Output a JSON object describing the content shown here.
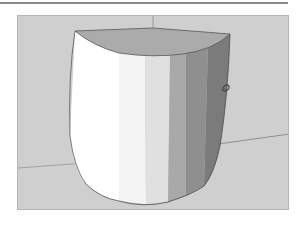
{
  "app": {
    "kind": "3d-modeling-viewport"
  },
  "viewport": {
    "background_color": "#cfcfcf",
    "model": {
      "shape": "extruded-arc-solid",
      "top_face_color": "#a9a9a9",
      "facet_colors": [
        "#ffffff",
        "#f0f0f0",
        "#e2e2e2",
        "#a8a8a8",
        "#8e8e8e",
        "#7a7a7a"
      ],
      "edge_color": "#4a4a4a"
    },
    "axes": {
      "color": "#9a9a9a"
    },
    "cursor": {
      "icon": "orbit-tool-cursor"
    }
  }
}
